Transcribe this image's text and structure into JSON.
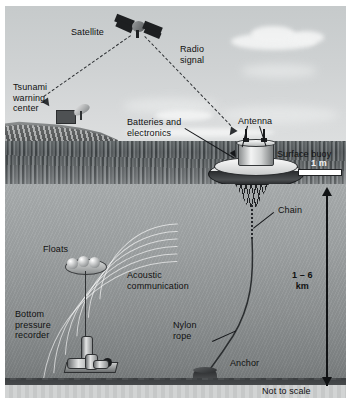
{
  "figure": {
    "background_color": "#ffffff",
    "frame_color": "#b9bdbf"
  },
  "labels": {
    "satellite": "Satellite",
    "radio_signal": "Radio\nsignal",
    "tsunami_warning_center": "Tsunami\nwarning\ncenter",
    "batteries_electronics": "Batteries and\nelectronics",
    "antenna": "Antenna",
    "surface_buoy": "Surface buoy",
    "scale_1m": "1 m",
    "chain": "Chain",
    "acoustic_communication": "Acoustic\ncommunication",
    "floats": "Floats",
    "bottom_pressure_recorder": "Bottom\npressure\nrecorder",
    "nylon_rope": "Nylon\nrope",
    "anchor": "Anchor",
    "depth_range": "1 – 6\nkm",
    "not_to_scale": "Not to scale"
  },
  "colors": {
    "sky": "#cfd2d3",
    "sea_surface": "#545a5d",
    "underwater": "#9ea2a3",
    "seafloor": "#46494b",
    "sediment": "#d2d4d4",
    "label_text": "#111111",
    "leader_line": "#15171a",
    "dashed_signal": "#2d3033",
    "wave_highlight": "#ffffff",
    "scalebar_fill": "#ffffff"
  },
  "measurements": {
    "depth_min_km": 1,
    "depth_max_km": 6,
    "buoy_scale_bar_m": 1,
    "scale_note": "Not to scale"
  },
  "components": [
    {
      "name": "satellite",
      "layer": "sky"
    },
    {
      "name": "tsunami-warning-center",
      "layer": "coast"
    },
    {
      "name": "surface-buoy",
      "layer": "sea-surface"
    },
    {
      "name": "antenna",
      "layer": "sea-surface"
    },
    {
      "name": "batteries-and-electronics",
      "layer": "sea-surface"
    },
    {
      "name": "chain",
      "layer": "underwater"
    },
    {
      "name": "nylon-rope",
      "layer": "underwater"
    },
    {
      "name": "anchor",
      "layer": "seafloor"
    },
    {
      "name": "floats",
      "layer": "underwater"
    },
    {
      "name": "bottom-pressure-recorder",
      "layer": "seafloor"
    },
    {
      "name": "acoustic-communication",
      "layer": "underwater"
    }
  ]
}
